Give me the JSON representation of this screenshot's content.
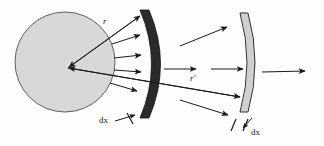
{
  "figure": {
    "type": "optics-ray-diagram",
    "background_color": "#fdfdfd",
    "width": 324,
    "height": 146,
    "labels": {
      "radius_inner": "r",
      "radius_outer": "r'",
      "thickness_left": "dx",
      "thickness_right": "dx"
    },
    "colors": {
      "sphere_fill": "#d8d8d8",
      "sphere_stroke": "#555555",
      "inner_shell_fill": "#2a2a2a",
      "inner_shell_stroke": "#1a1a1a",
      "outer_shell_fill": "#d0d0d0",
      "outer_shell_stroke": "#333333",
      "ray_color": "#1a1a1a",
      "text_color": "#1a1a1a"
    },
    "elements": {
      "sphere": {
        "name": "source-sphere",
        "cx": 65,
        "cy": 62,
        "r": 50
      },
      "apex": {
        "x": 68,
        "y": 68
      },
      "inner_shell": {
        "name": "inner-absorbing-shell",
        "x_center": 148,
        "top_y": 10,
        "bottom_y": 118,
        "thickness": 9
      },
      "outer_shell": {
        "name": "outer-absorbing-shell",
        "x_center": 247,
        "top_y": 13,
        "bottom_y": 112,
        "thickness": 8
      }
    },
    "rays": {
      "inner_fan_count": 4,
      "between_shells_count": 3,
      "beyond_outer_count": 1
    }
  }
}
